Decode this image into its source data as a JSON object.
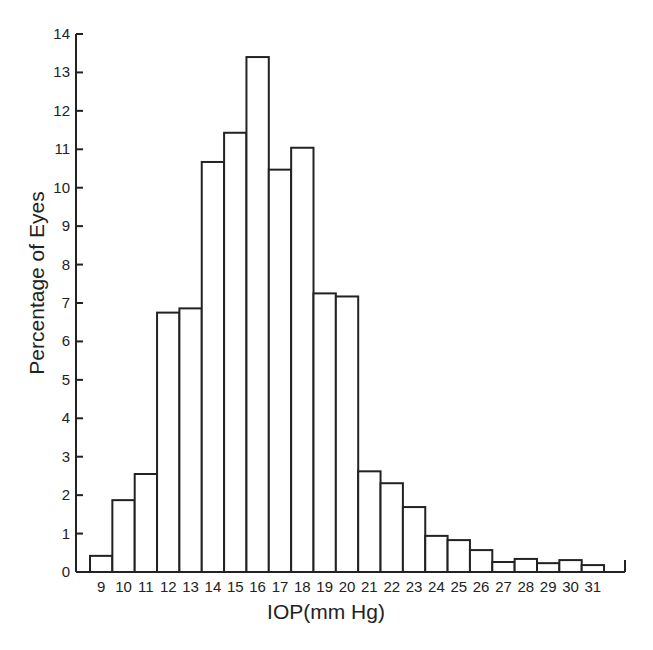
{
  "chart_data": {
    "type": "bar",
    "title": "",
    "xlabel": "IOP(mm Hg)",
    "ylabel": "Percentage of Eyes",
    "ylim": [
      0,
      14
    ],
    "yticks": [
      0,
      1,
      2,
      3,
      4,
      5,
      6,
      7,
      8,
      9,
      10,
      11,
      12,
      13,
      14
    ],
    "grid": false,
    "legend": null,
    "categories": [
      "9",
      "10",
      "11",
      "12",
      "13",
      "14",
      "15",
      "16",
      "17",
      "18",
      "19",
      "20",
      "21",
      "22",
      "23",
      "24",
      "25",
      "26",
      "27",
      "28",
      "29",
      "30",
      "31"
    ],
    "values": [
      0.42,
      1.87,
      2.55,
      6.75,
      6.86,
      10.67,
      11.43,
      13.4,
      10.47,
      11.04,
      7.25,
      7.17,
      2.62,
      2.31,
      1.69,
      0.94,
      0.83,
      0.57,
      0.26,
      0.34,
      0.23,
      0.31,
      0.18
    ],
    "colors": {
      "bar_fill": "#ffffff",
      "bar_stroke": "#222222",
      "axis": "#222222"
    }
  }
}
